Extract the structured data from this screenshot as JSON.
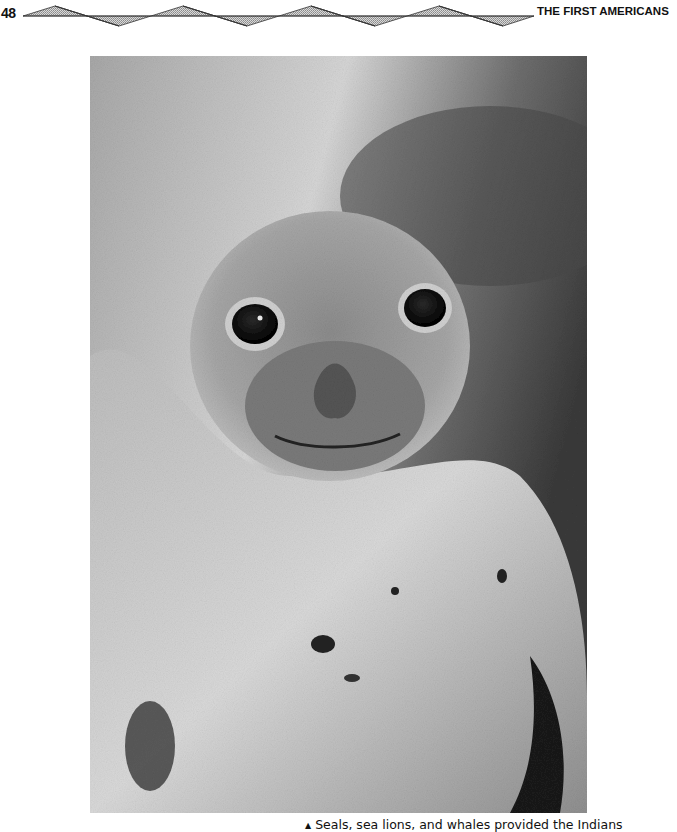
{
  "header": {
    "page_number": "48",
    "running_title": "THE FIRST AMERICANS",
    "ornament": "zigzag-triangle-band"
  },
  "figure": {
    "style": "black-and-white halftone photograph"
  },
  "caption": {
    "marker": "▲",
    "text": "Seals, sea lions, and whales provided the Indians"
  }
}
